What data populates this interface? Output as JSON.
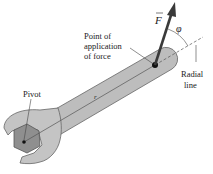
{
  "diagram": {
    "labels": {
      "force_symbol": "F",
      "angle_symbol": "φ",
      "point_of_application_line1": "Point of",
      "point_of_application_line2": "application",
      "point_of_application_line3": "of force",
      "radial_line_line1": "Radial",
      "radial_line_line2": "line",
      "pivot": "Pivot",
      "radius": "r"
    },
    "colors": {
      "wrench_fill": "#bdbdbd",
      "wrench_stroke": "#555555",
      "bolt_fill": "#8f8f8f",
      "arrow": "#3a3a3a",
      "text": "#222222",
      "background": "#ffffff"
    }
  }
}
